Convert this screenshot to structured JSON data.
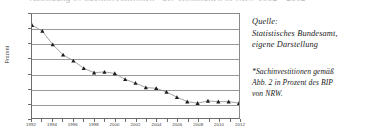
{
  "cutoff_text": "Abbildung 3: Sachinvestitionen* der Kommunen in NRW 1992 - 2012",
  "chart_data": {
    "type": "line",
    "title": "",
    "xlabel": "",
    "ylabel": "Prozent",
    "ylim": [
      0.3,
      1.7
    ],
    "ystep": 0.2,
    "grid": true,
    "legend": "none",
    "marker": "triangle",
    "decimal_separator": ",",
    "ytick_labels": [
      "1,7",
      "1,5",
      "1,3",
      "1,1",
      "0,9",
      "0,7",
      "0,5",
      "0,3"
    ],
    "ytick_values": [
      1.7,
      1.5,
      1.3,
      1.1,
      0.9,
      0.7,
      0.5,
      0.3
    ],
    "xtick_labels": [
      "1992",
      "1994",
      "1996",
      "1998",
      "2000",
      "2002",
      "2004",
      "2006",
      "2008",
      "2010",
      "2012"
    ],
    "x": [
      1992,
      1993,
      1994,
      1995,
      1996,
      1997,
      1998,
      1999,
      2000,
      2001,
      2002,
      2003,
      2004,
      2005,
      2006,
      2007,
      2008,
      2009,
      2010,
      2011,
      2012
    ],
    "values": [
      1.55,
      1.47,
      1.29,
      1.15,
      1.07,
      0.97,
      0.91,
      0.92,
      0.9,
      0.82,
      0.77,
      0.71,
      0.7,
      0.65,
      0.58,
      0.52,
      0.5,
      0.53,
      0.52,
      0.52,
      0.5
    ],
    "series": [
      {
        "name": "Sachinvestitionen",
        "values": [
          1.55,
          1.47,
          1.29,
          1.15,
          1.07,
          0.97,
          0.91,
          0.92,
          0.9,
          0.82,
          0.77,
          0.71,
          0.7,
          0.65,
          0.58,
          0.52,
          0.5,
          0.53,
          0.52,
          0.52,
          0.5
        ]
      }
    ],
    "line_color": "#8c8c8c",
    "marker_color": "#1c1c1c",
    "grid_color": "#9a9a9a"
  },
  "notes": {
    "source": {
      "line1": "Quelle:",
      "line2": "Statistisches Bundesamt,",
      "line3": "eigene Darstellung"
    },
    "footnote": {
      "line1": "*Sachinvestitionen gemäß",
      "line2": "Abb. 2 in Prozent des BIP",
      "line3": "von NRW."
    }
  }
}
